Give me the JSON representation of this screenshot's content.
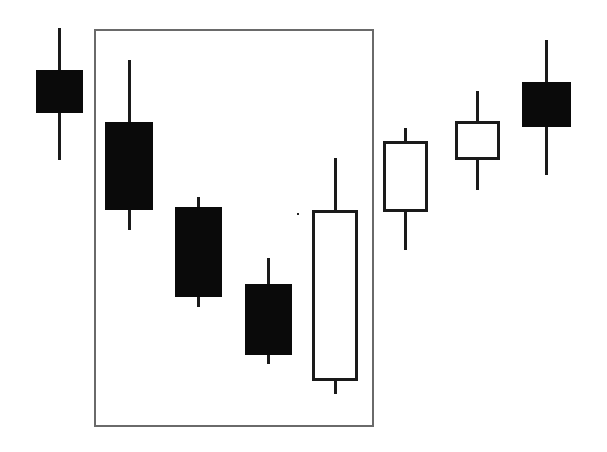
{
  "chart_data": {
    "type": "candlestick",
    "title": "",
    "xlabel": "",
    "ylabel": "",
    "grid": false,
    "legend": null,
    "axes_visible": false,
    "ylim": [
      50,
      430
    ],
    "colors": {
      "bear_fill": "#0a0a0a",
      "bull_fill": "#ffffff",
      "outline": "#1a1a1a",
      "highlight_frame": "#6a6a6a"
    },
    "candles": [
      {
        "index": 1,
        "direction": "bearish",
        "open": 382,
        "high": 424,
        "low": 292,
        "close": 339
      },
      {
        "index": 2,
        "direction": "bearish",
        "open": 330,
        "high": 392,
        "low": 222,
        "close": 242
      },
      {
        "index": 3,
        "direction": "bearish",
        "open": 245,
        "high": 255,
        "low": 145,
        "close": 155
      },
      {
        "index": 4,
        "direction": "bearish",
        "open": 168,
        "high": 194,
        "low": 88,
        "close": 97
      },
      {
        "index": 5,
        "direction": "bullish",
        "open": 71,
        "high": 294,
        "low": 58,
        "close": 242
      },
      {
        "index": 6,
        "direction": "bullish",
        "open": 240,
        "high": 324,
        "low": 202,
        "close": 311
      },
      {
        "index": 7,
        "direction": "bullish",
        "open": 292,
        "high": 361,
        "low": 262,
        "close": 331
      },
      {
        "index": 8,
        "direction": "bearish",
        "open": 370,
        "high": 412,
        "low": 277,
        "close": 325
      }
    ],
    "annotations": [
      {
        "type": "rectangle",
        "label": "",
        "encloses_candles": [
          2,
          3,
          4,
          5
        ]
      }
    ]
  },
  "layout": {
    "frame": {
      "x": 94,
      "y": 29,
      "w": 280,
      "h": 398
    },
    "candles_px": [
      {
        "x": 36,
        "w": 47,
        "wick_top": 28,
        "wick_bottom": 160,
        "body_top": 70,
        "body_bottom": 113
      },
      {
        "x": 105,
        "w": 48,
        "wick_top": 60,
        "wick_bottom": 230,
        "body_top": 122,
        "body_bottom": 210
      },
      {
        "x": 175,
        "w": 47,
        "wick_top": 197,
        "wick_bottom": 307,
        "body_top": 207,
        "body_bottom": 297
      },
      {
        "x": 245,
        "w": 47,
        "wick_top": 258,
        "wick_bottom": 364,
        "body_top": 284,
        "body_bottom": 355
      },
      {
        "x": 312,
        "w": 46,
        "wick_top": 158,
        "wick_bottom": 394,
        "body_top": 210,
        "body_bottom": 381
      },
      {
        "x": 383,
        "w": 45,
        "wick_top": 128,
        "wick_bottom": 250,
        "body_top": 141,
        "body_bottom": 212
      },
      {
        "x": 455,
        "w": 45,
        "wick_top": 91,
        "wick_bottom": 190,
        "body_top": 121,
        "body_bottom": 160
      },
      {
        "x": 522,
        "w": 49,
        "wick_top": 40,
        "wick_bottom": 175,
        "body_top": 82,
        "body_bottom": 127
      }
    ]
  }
}
